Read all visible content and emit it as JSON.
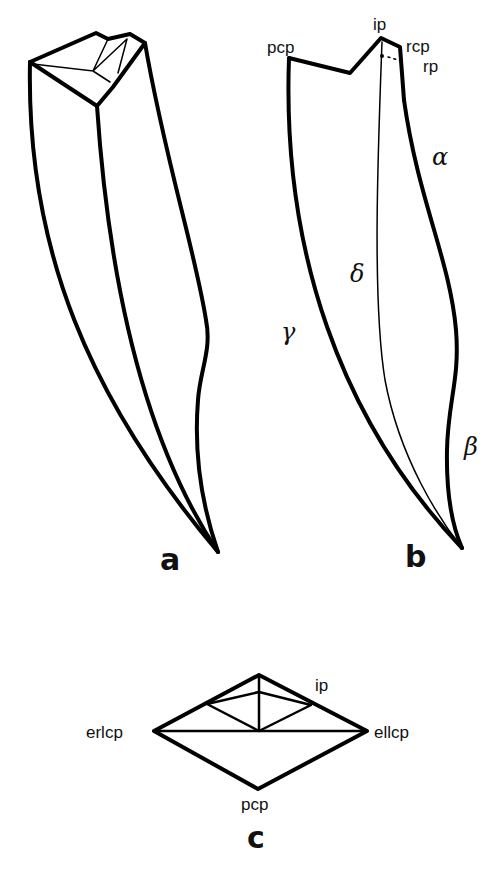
{
  "figure": {
    "panels": [
      {
        "id": "a",
        "label": "a",
        "description": "Oblique view of tooth crown with occlusal facets"
      },
      {
        "id": "b",
        "label": "b",
        "description": "Lateral outline with labelled points and edges",
        "point_labels": {
          "pcp": "pcp",
          "ip": "ip",
          "rcp": "rcp",
          "rp": "rp"
        },
        "edge_labels": {
          "alpha": "α",
          "beta": "β",
          "gamma": "γ",
          "delta": "δ"
        }
      },
      {
        "id": "c",
        "label": "c",
        "description": "Occlusal (cross-section) view",
        "point_labels": {
          "ip": "ip",
          "erlcp": "erlcp",
          "ellcp": "ellcp",
          "pcp": "pcp"
        }
      }
    ]
  }
}
